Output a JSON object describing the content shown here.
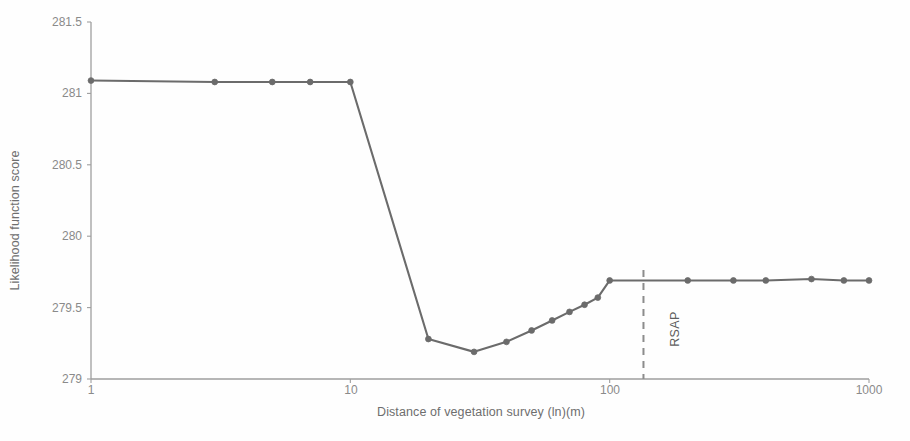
{
  "chart_data": {
    "type": "line",
    "title": "",
    "xlabel": "Distance of vegetation survey (ln)(m)",
    "ylabel": "Likelihood function score",
    "xscale": "log",
    "xlim": [
      1,
      1000
    ],
    "ylim": [
      279,
      281.5
    ],
    "yticks": [
      "279",
      "279.5",
      "280",
      "280.5",
      "281",
      "281.5"
    ],
    "ytick_values": [
      279,
      279.5,
      280,
      280.5,
      281,
      281.5
    ],
    "xticks": [
      "1",
      "10",
      "100",
      "1000"
    ],
    "xtick_values": [
      1,
      10,
      100,
      1000
    ],
    "grid": false,
    "legend": "none",
    "series": [
      {
        "name": "Likelihood function score",
        "color": "#6b6b6b",
        "marker": "circle",
        "x": [
          1,
          3,
          5,
          7,
          10,
          20,
          30,
          40,
          50,
          60,
          70,
          80,
          90,
          100,
          200,
          300,
          400,
          600,
          800,
          1000
        ],
        "values": [
          281.09,
          281.08,
          281.08,
          281.08,
          281.08,
          279.28,
          279.19,
          279.26,
          279.34,
          279.41,
          279.47,
          279.52,
          279.57,
          279.69,
          279.69,
          279.69,
          279.69,
          279.7,
          279.69,
          279.69
        ]
      }
    ],
    "annotations": [
      {
        "name": "RSAP",
        "label": "RSAP",
        "type": "vertical-dashed-line",
        "x": 135,
        "color": "#8c8c8c",
        "label_rotation": -90
      }
    ]
  }
}
